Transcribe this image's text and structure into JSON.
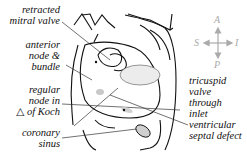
{
  "labels": {
    "retracted_mitral_valve": "retracted\nmitral valve",
    "anterior_node": "anterior\nnode &\nbundle",
    "regular_node": "regular\nnode in\n△ of Koch",
    "coronary_sinus": "coronary\nsinus",
    "tricuspid": "tricuspid\nvalve\nthrough\ninlet\nventricular\nseptal defect"
  },
  "compass": {
    "top": "A",
    "bottom": "P",
    "left": "S",
    "right": "I"
  },
  "colors": {
    "line": "#111111",
    "compass": "#aaaaaa",
    "shade": "#bbbbbb"
  }
}
